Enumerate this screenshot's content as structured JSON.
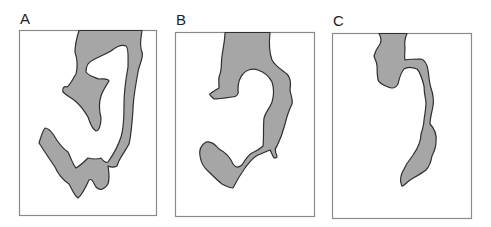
{
  "figure": {
    "colors": {
      "blob_fill": "#a6a6a6",
      "blob_stroke": "#2f2f2f",
      "frame": "#8a8a8a",
      "background": "#ffffff"
    },
    "panels": [
      {
        "label": "A",
        "frame": {
          "x": 19,
          "y": 30,
          "w": 137,
          "h": 185
        }
      },
      {
        "label": "B",
        "frame": {
          "x": 175,
          "y": 32,
          "w": 139,
          "h": 184
        }
      },
      {
        "label": "C",
        "frame": {
          "x": 332,
          "y": 33,
          "w": 139,
          "h": 185
        }
      }
    ]
  }
}
